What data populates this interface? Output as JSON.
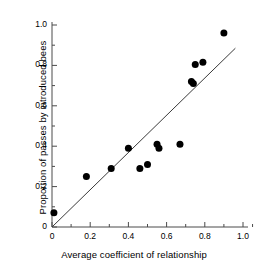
{
  "chart_data": {
    "type": "scatter",
    "title": "",
    "xlabel": "Average coefficient of relationship",
    "ylabel": "Proportion of passes by introduced bees",
    "xlim": [
      0,
      1.05
    ],
    "ylim": [
      0,
      1.05
    ],
    "xticks": [
      0,
      0.2,
      0.4,
      0.6,
      0.8,
      1.0
    ],
    "xtick_labels": [
      "0",
      "0.2",
      "0.4",
      "0.6",
      "0.8",
      "1.0"
    ],
    "yticks": [
      0,
      0.2,
      0.4,
      0.6,
      0.8,
      1.0
    ],
    "ytick_labels": [
      "0",
      "0.2",
      "0.4",
      "0.6",
      "0.8",
      "1.0"
    ],
    "minor_ticks": true,
    "grid": false,
    "legend": "none",
    "marker": "filled-circle",
    "marker_color": "#000000",
    "marker_size": 6,
    "points": [
      {
        "x": 0.01,
        "y": 0.07
      },
      {
        "x": 0.18,
        "y": 0.25
      },
      {
        "x": 0.31,
        "y": 0.29
      },
      {
        "x": 0.4,
        "y": 0.39
      },
      {
        "x": 0.46,
        "y": 0.29
      },
      {
        "x": 0.5,
        "y": 0.31
      },
      {
        "x": 0.55,
        "y": 0.41
      },
      {
        "x": 0.56,
        "y": 0.39
      },
      {
        "x": 0.67,
        "y": 0.41
      },
      {
        "x": 0.73,
        "y": 0.72
      },
      {
        "x": 0.74,
        "y": 0.71
      },
      {
        "x": 0.75,
        "y": 0.805
      },
      {
        "x": 0.79,
        "y": 0.815
      },
      {
        "x": 0.9,
        "y": 0.96
      }
    ],
    "trend_line": {
      "type": "line",
      "x_start": 0.0,
      "y_start": 0.0,
      "x_end": 0.96,
      "y_end": 0.885,
      "color": "#3a3a3a"
    }
  }
}
